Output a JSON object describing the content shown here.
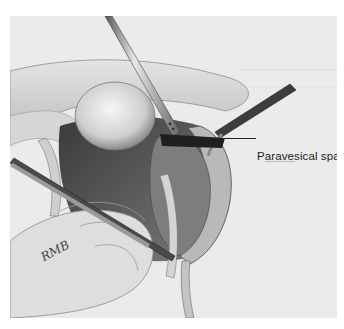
{
  "figure": {
    "callouts": [
      {
        "label": "Paravesical space"
      }
    ],
    "signature": "RMB"
  },
  "colors": {
    "background": "#ffffff",
    "paper": "#ebebeb",
    "ink": "#222222"
  }
}
